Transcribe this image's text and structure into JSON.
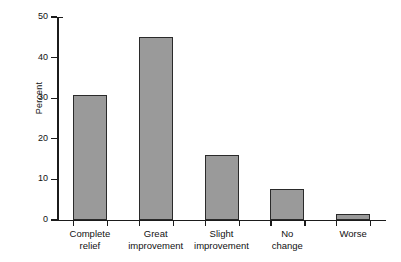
{
  "chart_data": {
    "type": "bar",
    "title": "",
    "subtitle": "",
    "xlabel": "",
    "ylabel": "Percent",
    "categories": [
      "Complete\nrelief",
      "Great\nimprovement",
      "Slight\nimprovement",
      "No\nchange",
      "Worse"
    ],
    "values": [
      30.8,
      45.0,
      16.0,
      7.6,
      1.5
    ],
    "ylim": [
      0,
      50
    ],
    "ytick_labels": [
      "0",
      "10",
      "20",
      "30",
      "40",
      "50"
    ],
    "ytick_values": [
      0,
      10,
      20,
      30,
      40,
      50
    ],
    "grid": false,
    "legend": false,
    "legend_position": "none",
    "annotations": [],
    "colors": {
      "bar_fill": "#9a9a9a",
      "bar_edge": "#2a2a2a",
      "axis": "#1b1b1b",
      "text": "#111111",
      "background": "#ffffff"
    }
  },
  "axis": {
    "y_label": "Percent",
    "y_ticks": [
      {
        "label": "50",
        "value": 50
      },
      {
        "label": "40",
        "value": 40
      },
      {
        "label": "30",
        "value": 30
      },
      {
        "label": "20",
        "value": 20
      },
      {
        "label": "10",
        "value": 10
      },
      {
        "label": "0",
        "value": 0
      }
    ]
  },
  "bars": [
    {
      "label": "Complete\nrelief",
      "value": 30.8
    },
    {
      "label": "Great\nimprovement",
      "value": 45.0
    },
    {
      "label": "Slight\nimprovement",
      "value": 16.0
    },
    {
      "label": "No\nchange",
      "value": 7.6
    },
    {
      "label": "Worse",
      "value": 1.5
    }
  ]
}
